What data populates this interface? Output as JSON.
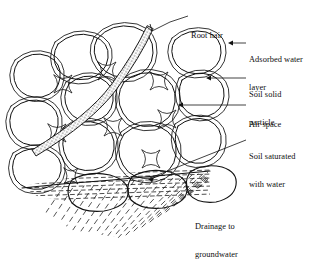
{
  "figure": {
    "background_color": "#ffffff",
    "line_color": "#111111",
    "labels": [
      {
        "id": "root-hair",
        "text": "Root hair",
        "lines": [
          "Root hair"
        ]
      },
      {
        "id": "adsorbed-water",
        "text": "Adsorbed water layer",
        "lines": [
          "Adsorbed water",
          "layer"
        ]
      },
      {
        "id": "soil-particle",
        "text": "Soil solid particle",
        "lines": [
          "Soil solid",
          "particle"
        ]
      },
      {
        "id": "air-space",
        "text": "Air space",
        "lines": [
          "Air space"
        ]
      },
      {
        "id": "soil-saturated",
        "text": "Soil saturated with water",
        "lines": [
          "Soil saturated",
          "with water"
        ]
      },
      {
        "id": "drainage",
        "text": "Drainage to groundwater",
        "lines": [
          "Drainage to",
          "groundwater"
        ]
      }
    ],
    "label_text": {
      "root_hair_l1": "Root hair",
      "adsorbed_l1": "Adsorbed water",
      "adsorbed_l2": "layer",
      "particle_l1": "Soil solid",
      "particle_l2": "particle",
      "air_l1": "Air space",
      "saturated_l1": "Soil saturated",
      "saturated_l2": "with water",
      "drainage_l1": "Drainage to",
      "drainage_l2": "groundwater"
    },
    "regions": {
      "unsaturated_zone": "Soil solid particles separated by air spaces, each grain wrapped in an adsorbed water layer",
      "saturated_zone": "Soil saturated with water, shown with horizontal dash hatching below the water table",
      "drainage_zone": "Drainage to groundwater, shown with diagonal dash hatching",
      "root_hair": "Tapered stippled root hair crossing the soil matrix diagonally"
    }
  }
}
